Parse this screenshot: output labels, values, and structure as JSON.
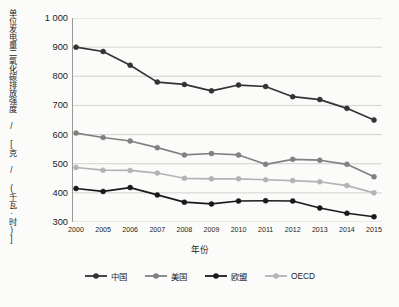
{
  "chart_data": {
    "type": "line",
    "title": "",
    "xlabel": "年份",
    "ylabel": "单位发电量二氧化碳排放强度 / [克 / (千瓦·时)]",
    "categories": [
      "2000",
      "2005",
      "2006",
      "2007",
      "2008",
      "2009",
      "2010",
      "2011",
      "2012",
      "2013",
      "2014",
      "2015"
    ],
    "ylim": [
      300,
      1000
    ],
    "ytick_labels": [
      "300",
      "400",
      "500",
      "600",
      "700",
      "800",
      "900",
      "1 000"
    ],
    "ytick_values": [
      300,
      400,
      500,
      600,
      700,
      800,
      900,
      1000
    ],
    "grid": true,
    "legend_position": "bottom",
    "series": [
      {
        "name": "中国",
        "color": "#333333",
        "values": [
          900,
          885,
          838,
          780,
          772,
          750,
          770,
          765,
          730,
          720,
          690,
          650
        ]
      },
      {
        "name": "美国",
        "color": "#808080",
        "values": [
          605,
          590,
          578,
          555,
          530,
          535,
          530,
          498,
          515,
          512,
          498,
          455
        ]
      },
      {
        "name": "欧盟",
        "color": "#1a1a1a",
        "values": [
          415,
          405,
          418,
          393,
          368,
          362,
          372,
          373,
          372,
          348,
          330,
          318
        ]
      },
      {
        "name": "OECD",
        "color": "#b3b3b3",
        "values": [
          487,
          478,
          477,
          468,
          450,
          448,
          448,
          445,
          442,
          438,
          425,
          400
        ]
      }
    ]
  },
  "colors": {
    "background": "#fbfbfa",
    "grid": "#c8c8c8",
    "axis": "#9a9a9a",
    "text": "#1c1c1c"
  }
}
